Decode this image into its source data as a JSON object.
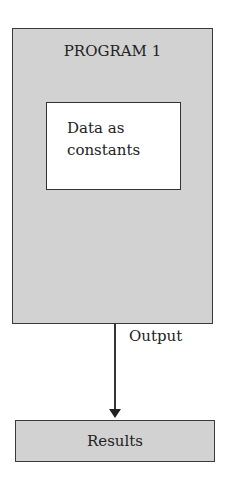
{
  "diagram": {
    "program_box": {
      "title": "PROGRAM 1",
      "fill": "#d2d2d2"
    },
    "inner_box": {
      "text": "Data as\nconstants",
      "fill": "#ffffff"
    },
    "arrow": {
      "label": "Output",
      "direction": "down"
    },
    "results_box": {
      "label": "Results",
      "fill": "#d2d2d2"
    }
  }
}
